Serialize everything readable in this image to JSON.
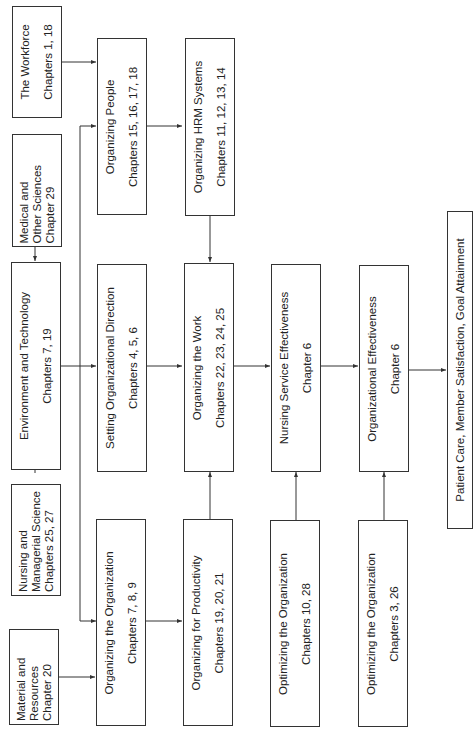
{
  "inputs": {
    "workforce": {
      "title": "The Workforce",
      "chapters": "Chapters 1, 18"
    },
    "medical": {
      "line1": "Medical and",
      "line2": "Other Sciences",
      "chapters": "Chapter 29"
    },
    "environment": {
      "title": "Environment and Technology",
      "chapters": "Chapters 7, 19"
    },
    "nursing_science": {
      "line1": "Nursing and",
      "line2": "Managerial Science",
      "chapters": "Chapters 25, 27"
    },
    "material": {
      "line1": "Material and",
      "line2": "Resources",
      "chapters": "Chapter 20"
    }
  },
  "column2": {
    "organizing_people": {
      "title": "Organizing People",
      "chapters": "Chapters 15, 16, 17, 18"
    },
    "setting_direction": {
      "title": "Setting Organizational Direction",
      "chapters": "Chapters 4, 5, 6"
    },
    "organizing_organization": {
      "title": "Organizing the Organization",
      "chapters": "Chapters 7, 8, 9"
    }
  },
  "column3": {
    "hrm_systems": {
      "title": "Organizing HRM Systems",
      "chapters": "Chapters 11, 12, 13, 14"
    },
    "organizing_work": {
      "title": "Organizing the Work",
      "chapters": "Chapters 22, 23, 24, 25"
    },
    "productivity": {
      "title": "Organizing for Productivity",
      "chapters": "Chapters 19, 20, 21"
    }
  },
  "column4": {
    "nursing_effectiveness": {
      "title": "Nursing Service Effectiveness",
      "chapters": "Chapter 6"
    },
    "optimizing_1": {
      "title": "Optimizing the Organization",
      "chapters": "Chapters 10, 28"
    }
  },
  "column5": {
    "org_effectiveness": {
      "title": "Organizational Effectiveness",
      "chapters": "Chapter 6"
    },
    "optimizing_2": {
      "title": "Optimizing the Organization",
      "chapters": "Chapters 3, 26"
    }
  },
  "outcome": {
    "title": "Patient Care, Member Satisfaction, Goal Attainment"
  }
}
